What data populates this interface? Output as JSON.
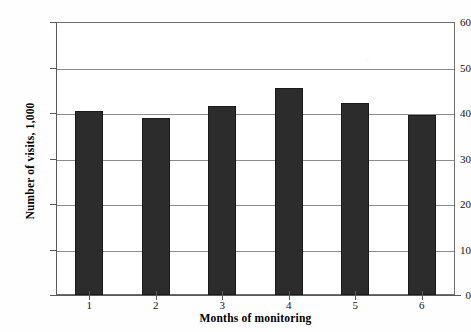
{
  "chart_data": {
    "type": "bar",
    "title": "",
    "xlabel": "Months of monitoring",
    "ylabel": "Number of visits, 1,000",
    "categories": [
      "1",
      "2",
      "3",
      "4",
      "5",
      "6"
    ],
    "values": [
      40.5,
      39.0,
      41.5,
      45.5,
      42.2,
      39.6
    ],
    "ylim": [
      0,
      60
    ],
    "yticks": [
      0,
      10,
      20,
      30,
      40,
      50,
      60
    ],
    "ytick_labels": [
      "0",
      "10",
      "20",
      "30",
      "40",
      "50",
      "60"
    ],
    "grid": true,
    "legend": false,
    "bar_color": "#2c2c2c",
    "gridline_color": "#8d8d8d",
    "axis_color": "#5a5a5a",
    "background_color": "#ffffff"
  }
}
